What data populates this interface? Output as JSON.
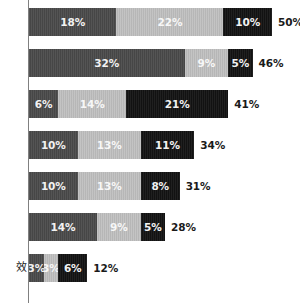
{
  "chart_data": {
    "type": "bar",
    "subtype": "stacked-horizontal",
    "title": "",
    "subtitle": "",
    "xlabel": "",
    "ylabel": "",
    "xlim": [
      0,
      50
    ],
    "grid": false,
    "legend_position": "none",
    "value_unit": "%",
    "series": [
      {
        "name": "segment-1",
        "color": "#4a4a4a",
        "values": [
          18,
          32,
          6,
          10,
          10,
          14,
          3
        ]
      },
      {
        "name": "segment-2",
        "color": "#bdbdbd",
        "values": [
          22,
          9,
          14,
          13,
          13,
          9,
          3
        ]
      },
      {
        "name": "segment-3",
        "color": "#141414",
        "values": [
          10,
          5,
          21,
          11,
          8,
          5,
          6
        ]
      }
    ],
    "categories": [
      "",
      "",
      "",
      "",
      "",
      "",
      "效"
    ],
    "totals": [
      50,
      46,
      41,
      34,
      31,
      28,
      12
    ]
  },
  "axis": {
    "line_color": "#808080"
  },
  "rows": [
    {
      "label": "",
      "total_label": "50%",
      "segments": [
        {
          "name": "segment-1",
          "value_label": "18%",
          "value": 18,
          "style": "seg-dark"
        },
        {
          "name": "segment-2",
          "value_label": "22%",
          "value": 22,
          "style": "seg-light"
        },
        {
          "name": "segment-3",
          "value_label": "10%",
          "value": 10,
          "style": "seg-black"
        }
      ]
    },
    {
      "label": "",
      "total_label": "46%",
      "segments": [
        {
          "name": "segment-1",
          "value_label": "32%",
          "value": 32,
          "style": "seg-dark"
        },
        {
          "name": "segment-2",
          "value_label": "9%",
          "value": 9,
          "style": "seg-light"
        },
        {
          "name": "segment-3",
          "value_label": "5%",
          "value": 5,
          "style": "seg-black"
        }
      ]
    },
    {
      "label": "",
      "total_label": "41%",
      "segments": [
        {
          "name": "segment-1",
          "value_label": "6%",
          "value": 6,
          "style": "seg-dark"
        },
        {
          "name": "segment-2",
          "value_label": "14%",
          "value": 14,
          "style": "seg-light"
        },
        {
          "name": "segment-3",
          "value_label": "21%",
          "value": 21,
          "style": "seg-black"
        }
      ]
    },
    {
      "label": "",
      "total_label": "34%",
      "segments": [
        {
          "name": "segment-1",
          "value_label": "10%",
          "value": 10,
          "style": "seg-dark"
        },
        {
          "name": "segment-2",
          "value_label": "13%",
          "value": 13,
          "style": "seg-light"
        },
        {
          "name": "segment-3",
          "value_label": "11%",
          "value": 11,
          "style": "seg-black"
        }
      ]
    },
    {
      "label": "",
      "total_label": "31%",
      "segments": [
        {
          "name": "segment-1",
          "value_label": "10%",
          "value": 10,
          "style": "seg-dark"
        },
        {
          "name": "segment-2",
          "value_label": "13%",
          "value": 13,
          "style": "seg-light"
        },
        {
          "name": "segment-3",
          "value_label": "8%",
          "value": 8,
          "style": "seg-black"
        }
      ]
    },
    {
      "label": "",
      "total_label": "28%",
      "segments": [
        {
          "name": "segment-1",
          "value_label": "14%",
          "value": 14,
          "style": "seg-dark"
        },
        {
          "name": "segment-2",
          "value_label": "9%",
          "value": 9,
          "style": "seg-light"
        },
        {
          "name": "segment-3",
          "value_label": "5%",
          "value": 5,
          "style": "seg-black"
        }
      ]
    },
    {
      "label": "效",
      "total_label": "12%",
      "segments": [
        {
          "name": "segment-1",
          "value_label": "3%",
          "value": 3,
          "style": "seg-dark"
        },
        {
          "name": "segment-2",
          "value_label": "3%",
          "value": 3,
          "style": "seg-light"
        },
        {
          "name": "segment-3",
          "value_label": "6%",
          "value": 6,
          "style": "seg-black"
        }
      ]
    }
  ],
  "layout": {
    "bar_origin_x": 29,
    "bar_height": 28,
    "row_pitch": 41,
    "first_row_top": 8,
    "px_per_percent": 4.86
  }
}
